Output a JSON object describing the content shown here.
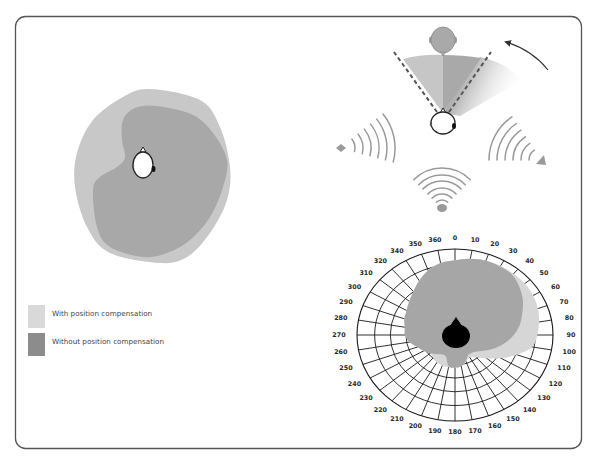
{
  "figure": {
    "legend": [
      {
        "label": "With position compensation",
        "color": "#d9d9d9"
      },
      {
        "label": "Without position compensation",
        "color": "#8c8c8c"
      }
    ],
    "left_panel": {
      "with_compensation_color": "#c8c8c8",
      "without_compensation_color": "#a8a8a8"
    },
    "top_right_panel": {
      "icons": [
        "source-head-icon",
        "listener-head-icon",
        "rotation-arrow-icon",
        "left-speaker-icon",
        "right-speaker-icon",
        "bottom-speaker-icon"
      ]
    }
  },
  "chart_data": {
    "type": "polar-area",
    "title": "",
    "angle_unit": "degrees",
    "angles": [
      0,
      10,
      20,
      30,
      40,
      50,
      60,
      70,
      80,
      90,
      100,
      110,
      120,
      130,
      140,
      150,
      160,
      170,
      180,
      190,
      200,
      210,
      220,
      230,
      240,
      250,
      260,
      270,
      280,
      290,
      300,
      310,
      320,
      330,
      340,
      350
    ],
    "radius_range": [
      0,
      1
    ],
    "grid": true,
    "angle_labels": [
      {
        "text": "0",
        "angle": 0
      },
      {
        "text": "10",
        "angle": 10
      },
      {
        "text": "20",
        "angle": 20
      },
      {
        "text": "30",
        "angle": 30
      },
      {
        "text": "40",
        "angle": 40
      },
      {
        "text": "50",
        "angle": 50
      },
      {
        "text": "60",
        "angle": 60
      },
      {
        "text": "70",
        "angle": 70
      },
      {
        "text": "80",
        "angle": 80
      },
      {
        "text": "90",
        "angle": 90
      },
      {
        "text": "100",
        "angle": 100
      },
      {
        "text": "110",
        "angle": 110
      },
      {
        "text": "120",
        "angle": 120
      },
      {
        "text": "130",
        "angle": 130
      },
      {
        "text": "140",
        "angle": 140
      },
      {
        "text": "150",
        "angle": 150
      },
      {
        "text": "160",
        "angle": 160
      },
      {
        "text": "170",
        "angle": 170
      },
      {
        "text": "180",
        "angle": 180
      },
      {
        "text": "190",
        "angle": 190
      },
      {
        "text": "200",
        "angle": 200
      },
      {
        "text": "210",
        "angle": 210
      },
      {
        "text": "220",
        "angle": 220
      },
      {
        "text": "230",
        "angle": 230
      },
      {
        "text": "240",
        "angle": 240
      },
      {
        "text": "250",
        "angle": 250
      },
      {
        "text": "260",
        "angle": 260
      },
      {
        "text": "270",
        "angle": 270
      },
      {
        "text": "280",
        "angle": 280
      },
      {
        "text": "290",
        "angle": 290
      },
      {
        "text": "300",
        "angle": 300
      },
      {
        "text": "310",
        "angle": 310
      },
      {
        "text": "320",
        "angle": 320
      },
      {
        "text": "340",
        "angle": 330
      },
      {
        "text": "350",
        "angle": 340
      },
      {
        "text": "360",
        "angle": 350
      }
    ],
    "series": [
      {
        "name": "With position compensation",
        "color": "#d6d6d6",
        "values": [
          0.87,
          0.9,
          0.92,
          0.93,
          0.93,
          0.93,
          0.92,
          0.9,
          0.87,
          0.84,
          0.8,
          0.67,
          0.54,
          0.42,
          0.34,
          0.3,
          0.33,
          0.37,
          0.38,
          0.38,
          0.38,
          0.37,
          0.35,
          0.33,
          0.37,
          0.41,
          0.47,
          0.51,
          0.52,
          0.55,
          0.57,
          0.61,
          0.66,
          0.73,
          0.8,
          0.85
        ]
      },
      {
        "name": "Without position compensation",
        "color": "#a6a6a6",
        "values": [
          0.87,
          0.9,
          0.92,
          0.92,
          0.91,
          0.86,
          0.8,
          0.73,
          0.67,
          0.6,
          0.52,
          0.44,
          0.36,
          0.3,
          0.27,
          0.27,
          0.32,
          0.37,
          0.38,
          0.37,
          0.27,
          0.26,
          0.29,
          0.33,
          0.37,
          0.41,
          0.47,
          0.51,
          0.52,
          0.55,
          0.57,
          0.61,
          0.66,
          0.73,
          0.8,
          0.85
        ]
      }
    ],
    "legend_position": "left"
  }
}
